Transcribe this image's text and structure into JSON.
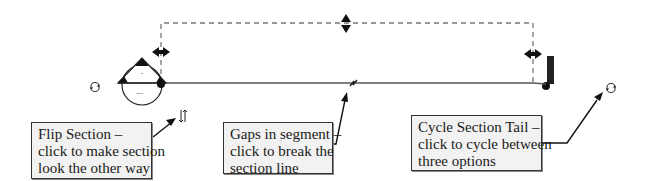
{
  "diagram": {
    "colors": {
      "background": "#ffffff",
      "line": "#555555",
      "dashed_extent": "#777777",
      "callout_fill": "#f2f2f2",
      "callout_border": "#333333",
      "glyph": "#111111"
    },
    "controls": [
      {
        "id": "flip-section",
        "icon": "flip-arrows-icon",
        "symbol": "⇵"
      },
      {
        "id": "cycle-head-left",
        "icon": "cycle-icon",
        "symbol": "↻"
      },
      {
        "id": "cycle-section-tail",
        "icon": "cycle-icon",
        "symbol": "↻"
      },
      {
        "id": "gap-in-segment",
        "icon": "break-zigzag-icon"
      },
      {
        "id": "resize-depth",
        "icon": "vertical-double-arrow-icon"
      },
      {
        "id": "resize-left-extent",
        "icon": "horizontal-double-arrow-icon"
      },
      {
        "id": "resize-right-extent",
        "icon": "horizontal-double-arrow-icon"
      }
    ],
    "section_head_left": {
      "top_label": "-",
      "bottom_label": "---"
    },
    "callouts": [
      {
        "id": "flip-section",
        "lines": [
          "Flip Section –",
          "click to make section",
          "look the other way"
        ]
      },
      {
        "id": "gaps-in-segment",
        "lines": [
          "Gaps in segment –",
          "click to break the",
          "section line"
        ]
      },
      {
        "id": "cycle-section-tail",
        "lines": [
          "Cycle Section Tail –",
          "click to cycle between",
          "three options"
        ]
      }
    ]
  }
}
